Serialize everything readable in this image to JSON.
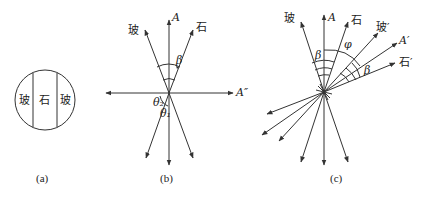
{
  "panels": [
    {
      "id": "a",
      "caption": "(a)",
      "regions": [
        "玻",
        "石",
        "玻"
      ]
    },
    {
      "id": "b",
      "caption": "(b)",
      "labels": {
        "glass": "玻",
        "stone": "石",
        "axis_A": "A",
        "axis_A2": "A″",
        "beta": "β",
        "theta2": "θ₂",
        "theta1": "θ₁"
      }
    },
    {
      "id": "c",
      "caption": "(c)",
      "labels": {
        "glass": "玻",
        "axis_A": "A",
        "stone": "石",
        "glass_prime": "玻′",
        "axis_A_prime": "A′",
        "stone_prime": "石′",
        "beta_left": "β",
        "phi": "φ",
        "beta_right": "β"
      }
    }
  ]
}
